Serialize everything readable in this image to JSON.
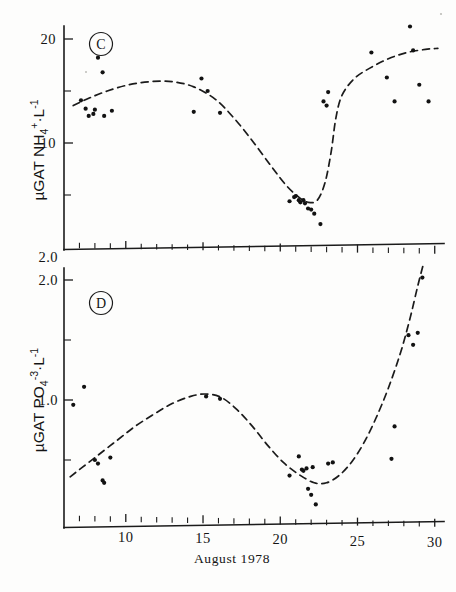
{
  "figure": {
    "caption_x": "August   1978",
    "background": "#fdfdfc",
    "ink_color": "#1b1b1b"
  },
  "panels": [
    {
      "letter": "C",
      "y_axis_label_parts": {
        "prefix": "µGAT NH",
        "sub": "4",
        "sup_charge": "+",
        "mid": "·L",
        "sup_exp": "-1"
      },
      "y_axis_label": "µGAT NH4+·L-1",
      "y_ticks_major": [
        "20",
        "10"
      ],
      "y_tick_bottom": "2.0"
    },
    {
      "letter": "D",
      "y_axis_label_parts": {
        "prefix": "µGAT PO",
        "sub": "4",
        "sup_charge": "-3",
        "mid": "·L",
        "sup_exp": "-1"
      },
      "y_axis_label": "µGAT PO4-3·L-1",
      "y_ticks_major": [
        "2.0",
        "1.0"
      ],
      "y_tick_bottom": ""
    }
  ],
  "chart_data": [
    {
      "type": "scatter",
      "panel": "C",
      "title": "C",
      "xlabel": "August   1978",
      "ylabel": "µGAT NH4+·L-1",
      "xlim": [
        6,
        30.5
      ],
      "ylim": [
        2.0,
        21.5
      ],
      "xticks": [
        10,
        15,
        20,
        25,
        30
      ],
      "xtick_labels": [
        "10",
        "15",
        "20",
        "25",
        "30"
      ],
      "yticks": [
        20,
        15,
        10,
        5
      ],
      "ytick_labels": [
        "20",
        "",
        "10",
        ""
      ],
      "ytick_labeled": [
        20,
        10
      ],
      "grid": false,
      "legend": "none",
      "x": [
        7.1,
        7.4,
        7.6,
        7.9,
        8.0,
        8.2,
        8.5,
        8.6,
        9.1,
        14.4,
        14.9,
        15.3,
        16.1,
        20.6,
        20.9,
        21.0,
        21.2,
        21.3,
        21.5,
        21.6,
        21.8,
        22.0,
        22.2,
        22.6,
        22.8,
        23.0,
        23.1,
        25.9,
        26.9,
        27.4,
        28.4,
        28.6,
        29.0,
        29.6
      ],
      "y": [
        14.1,
        13.3,
        12.6,
        12.8,
        13.2,
        18.2,
        16.8,
        12.6,
        13.1,
        13.0,
        16.2,
        15.0,
        12.9,
        4.4,
        4.8,
        4.9,
        4.5,
        4.3,
        4.5,
        4.2,
        3.7,
        3.6,
        3.2,
        2.2,
        14.0,
        13.6,
        14.9,
        18.7,
        16.3,
        14.0,
        21.2,
        18.9,
        15.6,
        14.0
      ],
      "curve_description": "dashed fitted curve: broad maximum ~16 near day 12-14, steep drop to minimum ~4 near day 22, steep rise back to ~19 by day 29",
      "curve_points": [
        [
          6.6,
          13.6
        ],
        [
          7.6,
          14.3
        ],
        [
          8.8,
          15.0
        ],
        [
          10.2,
          15.6
        ],
        [
          11.6,
          15.9
        ],
        [
          13.0,
          15.9
        ],
        [
          14.4,
          15.4
        ],
        [
          15.8,
          14.2
        ],
        [
          17.0,
          12.4
        ],
        [
          18.2,
          10.2
        ],
        [
          19.4,
          7.8
        ],
        [
          20.4,
          5.9
        ],
        [
          21.2,
          4.8
        ],
        [
          21.8,
          4.3
        ],
        [
          22.4,
          4.5
        ],
        [
          22.9,
          6.2
        ],
        [
          23.3,
          9.2
        ],
        [
          23.6,
          12.4
        ],
        [
          24.0,
          14.6
        ],
        [
          24.8,
          16.2
        ],
        [
          25.8,
          17.2
        ],
        [
          27.0,
          18.1
        ],
        [
          28.2,
          18.7
        ],
        [
          29.4,
          19.0
        ],
        [
          30.2,
          19.1
        ]
      ]
    },
    {
      "type": "scatter",
      "panel": "D",
      "title": "D",
      "xlabel": "August   1978",
      "ylabel": "µGAT PO4-3·L-1",
      "xlim": [
        6,
        30.5
      ],
      "ylim": [
        0.0,
        2.1
      ],
      "xticks": [
        10,
        15,
        20,
        25,
        30
      ],
      "xtick_labels": [
        "10",
        "15",
        "20",
        "25",
        "30"
      ],
      "yticks": [
        2.0,
        1.5,
        1.0,
        0.5
      ],
      "ytick_labels": [
        "2.0",
        "",
        "1.0",
        ""
      ],
      "ytick_labeled": [
        2.0,
        1.0
      ],
      "grid": false,
      "legend": "none",
      "x": [
        6.6,
        7.3,
        8.0,
        8.2,
        8.5,
        8.6,
        9.0,
        15.2,
        16.1,
        20.6,
        21.2,
        21.4,
        21.5,
        21.7,
        21.8,
        22.0,
        22.1,
        22.3,
        23.1,
        23.4,
        27.2,
        27.4,
        28.3,
        28.6,
        28.9,
        29.2
      ],
      "y": [
        0.96,
        1.11,
        0.5,
        0.47,
        0.33,
        0.31,
        0.52,
        1.03,
        1.01,
        0.37,
        0.53,
        0.42,
        0.41,
        0.43,
        0.26,
        0.21,
        0.44,
        0.13,
        0.47,
        0.48,
        0.51,
        0.78,
        1.54,
        1.46,
        1.56,
        2.02
      ],
      "curve_description": "dashed fitted curve: rises from ~0.38 at day 6.5 to maximum ~1.05 near day 15, falls to minimum ~0.30 near day 22.5, then rises steeply past 2.0 by day 29",
      "curve_points": [
        [
          6.4,
          0.36
        ],
        [
          7.2,
          0.44
        ],
        [
          8.2,
          0.54
        ],
        [
          9.4,
          0.66
        ],
        [
          10.6,
          0.78
        ],
        [
          11.8,
          0.88
        ],
        [
          13.0,
          0.97
        ],
        [
          14.2,
          1.03
        ],
        [
          15.2,
          1.05
        ],
        [
          16.2,
          1.02
        ],
        [
          17.2,
          0.92
        ],
        [
          18.2,
          0.78
        ],
        [
          19.2,
          0.62
        ],
        [
          20.2,
          0.48
        ],
        [
          21.2,
          0.38
        ],
        [
          22.2,
          0.31
        ],
        [
          23.0,
          0.31
        ],
        [
          23.8,
          0.37
        ],
        [
          24.6,
          0.48
        ],
        [
          25.4,
          0.64
        ],
        [
          26.2,
          0.85
        ],
        [
          27.0,
          1.1
        ],
        [
          27.8,
          1.4
        ],
        [
          28.4,
          1.68
        ],
        [
          28.9,
          1.95
        ],
        [
          29.3,
          2.15
        ]
      ]
    }
  ]
}
